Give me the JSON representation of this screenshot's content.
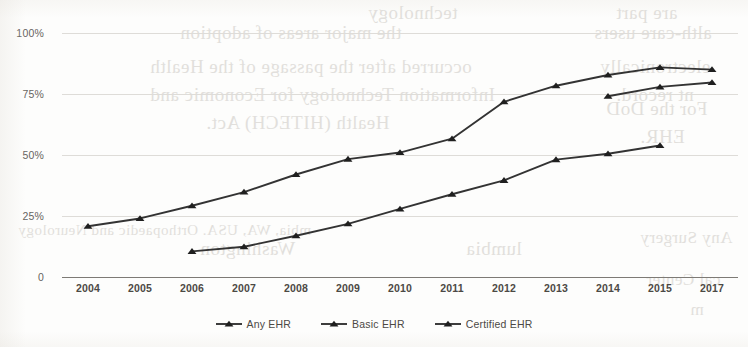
{
  "chart_data": {
    "type": "line",
    "title": "",
    "xlabel": "",
    "ylabel": "",
    "categories": [
      "2004",
      "2005",
      "2006",
      "2007",
      "2008",
      "2009",
      "2010",
      "2011",
      "2012",
      "2013",
      "2014",
      "2015",
      "2017"
    ],
    "ylim": [
      0,
      100
    ],
    "ytick_labels": [
      "0",
      "25%",
      "50%",
      "75%",
      "100%"
    ],
    "ytick_values": [
      0,
      25,
      50,
      75,
      100
    ],
    "grid": true,
    "legend_position": "bottom",
    "marker": "triangle",
    "series": [
      {
        "name": "Any EHR",
        "values": [
          20.8,
          24.0,
          29.2,
          34.8,
          42.0,
          48.3,
          51.0,
          56.7,
          71.8,
          78.4,
          82.8,
          85.9,
          85.0
        ]
      },
      {
        "name": "Basic EHR",
        "values": [
          null,
          null,
          10.5,
          12.4,
          16.9,
          21.8,
          27.9,
          33.9,
          39.6,
          48.1,
          50.5,
          53.9,
          null
        ]
      },
      {
        "name": "Certified EHR",
        "values": [
          null,
          null,
          null,
          null,
          null,
          null,
          null,
          null,
          null,
          null,
          74.1,
          77.9,
          79.7
        ]
      }
    ]
  },
  "legend": {
    "items": [
      {
        "label": "Any EHR"
      },
      {
        "label": "Basic EHR"
      },
      {
        "label": "Certified EHR"
      }
    ]
  },
  "colors": {
    "line": "#333333",
    "marker": "#1f1f1f",
    "grid": "#dedcd8",
    "axis": "#7d7a75",
    "tick_text": "#4c4945",
    "ytick_text": "#67645f",
    "paper": "#fdfdfc"
  },
  "background_showthrough": {
    "note": "faint mirrored text bleeding through from the reverse side of the scanned page",
    "lines": [
      {
        "text": "technology",
        "x": 368,
        "y": 2,
        "size": 19
      },
      {
        "text": "the   major   areas   of   adoption",
        "x": 180,
        "y": 22,
        "size": 19
      },
      {
        "text": "occurred after the passage of the Health",
        "x": 150,
        "y": 56,
        "size": 19
      },
      {
        "text": "Information Technology for Economic and",
        "x": 150,
        "y": 84,
        "size": 19
      },
      {
        "text": "Health   (HITECH)   Act.",
        "x": 206,
        "y": 112,
        "size": 19
      },
      {
        "text": "are  part",
        "x": 616,
        "y": 2,
        "size": 19
      },
      {
        "text": "alth-care users",
        "x": 594,
        "y": 22,
        "size": 19
      },
      {
        "text": "electronically",
        "x": 600,
        "y": 56,
        "size": 19
      },
      {
        "text": "nt record.",
        "x": 616,
        "y": 84,
        "size": 19
      },
      {
        "text": "For  the  DoD",
        "x": 606,
        "y": 98,
        "size": 19
      },
      {
        "text": "EHR.",
        "x": 640,
        "y": 126,
        "size": 19
      },
      {
        "text": "mbia, WA, USA.  Orthopaedic and Neurology",
        "x": 18,
        "y": 222,
        "size": 15
      },
      {
        "text": "Washington",
        "x": 200,
        "y": 238,
        "size": 19
      },
      {
        "text": "lumbia",
        "x": 466,
        "y": 238,
        "size": 19
      },
      {
        "text": "Any  Surgery",
        "x": 640,
        "y": 228,
        "size": 17
      },
      {
        "text": "cal Center",
        "x": 646,
        "y": 270,
        "size": 17
      },
      {
        "text": "m",
        "x": 690,
        "y": 300,
        "size": 17
      }
    ]
  }
}
